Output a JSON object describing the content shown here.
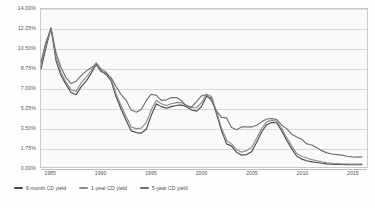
{
  "chart_data": {
    "type": "line",
    "title": "",
    "subtitle": "",
    "xlabel": "",
    "ylabel": "",
    "xlim": [
      1984,
      2016.5
    ],
    "ylim": [
      0,
      14
    ],
    "grid": true,
    "legend_position": "bottom-left",
    "y_ticks": [
      "0.00%",
      "1.75%",
      "3.50%",
      "5.25%",
      "7.00%",
      "8.75%",
      "10.50%",
      "12.25%",
      "14.00%"
    ],
    "y_tick_values": [
      0,
      1.75,
      3.5,
      5.25,
      7,
      8.75,
      10.5,
      12.25,
      14
    ],
    "x_ticks": [
      "1985",
      "1990",
      "1995",
      "2000",
      "2005",
      "2010",
      "2015"
    ],
    "x_tick_values": [
      1985,
      1990,
      1995,
      2000,
      2005,
      2010,
      2015
    ],
    "x": [
      1984.0,
      1984.5,
      1985.0,
      1985.5,
      1986.0,
      1986.5,
      1987.0,
      1987.5,
      1988.0,
      1988.5,
      1989.0,
      1989.5,
      1990.0,
      1990.5,
      1991.0,
      1991.5,
      1992.0,
      1992.5,
      1993.0,
      1993.5,
      1994.0,
      1994.5,
      1995.0,
      1995.5,
      1996.0,
      1996.5,
      1997.0,
      1997.5,
      1998.0,
      1998.5,
      1999.0,
      1999.5,
      2000.0,
      2000.5,
      2001.0,
      2001.5,
      2002.0,
      2002.5,
      2003.0,
      2003.5,
      2004.0,
      2004.5,
      2005.0,
      2005.5,
      2006.0,
      2006.5,
      2007.0,
      2007.5,
      2008.0,
      2008.5,
      2009.0,
      2009.5,
      2010.0,
      2010.5,
      2011.0,
      2011.5,
      2012.0,
      2012.5,
      2013.0,
      2013.5,
      2014.0,
      2014.5,
      2015.0,
      2015.5,
      2016.0
    ],
    "series": [
      {
        "name": "6-month CD yield",
        "color": "#4a4a4a",
        "values": [
          8.7,
          10.6,
          12.3,
          9.4,
          8.1,
          7.3,
          6.6,
          6.4,
          7.1,
          7.6,
          8.3,
          9.1,
          8.5,
          8.2,
          7.6,
          6.2,
          5.1,
          4.1,
          3.2,
          3.05,
          3.0,
          3.35,
          4.6,
          5.6,
          5.35,
          5.2,
          5.35,
          5.45,
          5.5,
          5.35,
          5.05,
          4.95,
          5.35,
          6.25,
          6.1,
          4.7,
          3.2,
          2.05,
          1.85,
          1.3,
          1.05,
          1.1,
          1.35,
          2.2,
          3.1,
          3.75,
          3.95,
          3.9,
          3.2,
          2.35,
          1.6,
          0.95,
          0.7,
          0.55,
          0.45,
          0.4,
          0.33,
          0.28,
          0.25,
          0.23,
          0.22,
          0.21,
          0.2,
          0.2,
          0.21
        ]
      },
      {
        "name": "1-year CD yield",
        "color": "#8c8c8c",
        "values": [
          9.0,
          10.85,
          12.35,
          9.7,
          8.35,
          7.5,
          6.85,
          6.7,
          7.45,
          7.95,
          8.55,
          9.25,
          8.7,
          8.4,
          7.8,
          6.45,
          5.4,
          4.45,
          3.55,
          3.4,
          3.45,
          3.95,
          5.1,
          5.9,
          5.6,
          5.45,
          5.6,
          5.7,
          5.7,
          5.5,
          5.25,
          5.25,
          5.7,
          6.45,
          6.25,
          4.9,
          3.45,
          2.35,
          2.05,
          1.55,
          1.3,
          1.45,
          1.75,
          2.55,
          3.4,
          4.0,
          4.15,
          4.05,
          3.4,
          2.6,
          1.85,
          1.2,
          0.95,
          0.8,
          0.65,
          0.55,
          0.45,
          0.38,
          0.33,
          0.3,
          0.28,
          0.27,
          0.26,
          0.26,
          0.27
        ]
      },
      {
        "name": "5-year CD yield",
        "color": "#6f6f6f",
        "values": [
          9.3,
          11.1,
          12.25,
          10.1,
          8.8,
          7.9,
          7.4,
          7.6,
          8.1,
          8.5,
          8.8,
          9.05,
          8.45,
          8.3,
          7.9,
          7.1,
          6.4,
          5.9,
          5.05,
          4.85,
          5.1,
          5.9,
          6.45,
          6.35,
          5.9,
          5.95,
          6.15,
          6.15,
          5.9,
          5.35,
          5.3,
          5.8,
          6.3,
          6.4,
          5.85,
          4.95,
          4.4,
          4.35,
          3.5,
          3.3,
          3.55,
          3.55,
          3.55,
          3.7,
          4.0,
          4.25,
          4.3,
          4.2,
          3.7,
          3.4,
          2.9,
          2.65,
          2.45,
          2.05,
          1.95,
          1.7,
          1.45,
          1.25,
          1.15,
          1.1,
          1.05,
          0.95,
          0.9,
          0.88,
          0.9
        ]
      }
    ]
  },
  "legend": {
    "items": [
      {
        "label": "6-month CD yield",
        "color": "#4a4a4a"
      },
      {
        "label": "1-year CD yield",
        "color": "#8c8c8c"
      },
      {
        "label": "5-year CD yield",
        "color": "#6f6f6f"
      }
    ]
  }
}
